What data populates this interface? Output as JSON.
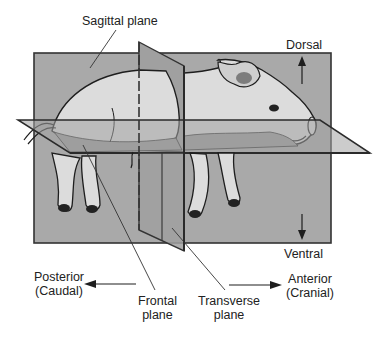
{
  "diagram": {
    "labels": {
      "sagittal": "Sagittal plane",
      "dorsal": "Dorsal",
      "ventral": "Ventral",
      "posterior_line1": "Posterior",
      "posterior_line2": "(Caudal)",
      "anterior_line1": "Anterior",
      "anterior_line2": "(Cranial)",
      "frontal_line1": "Frontal",
      "frontal_line2": "plane",
      "transverse_line1": "Transverse",
      "transverse_line2": "plane"
    },
    "colors": {
      "plane_fill": "#a9a9a9",
      "plane_dark": "#8e8e8e",
      "plane_edge": "#333333",
      "pig_fill": "#dcdcdc",
      "pig_shadow": "#9a9a9a",
      "outline": "#1e1e1e"
    }
  }
}
